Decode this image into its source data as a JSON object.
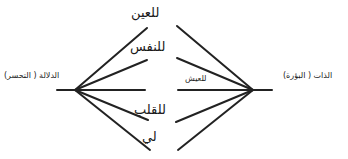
{
  "diagram": {
    "type": "two-hub fan diagram",
    "line_color": "#222222",
    "left_node": {
      "label": "الدلالة ( التحسر)"
    },
    "right_node": {
      "label": "الذات ( البؤرة)"
    },
    "branches": [
      {
        "label": "للعين"
      },
      {
        "label": "للنفس"
      },
      {
        "label": "للعيش"
      },
      {
        "label": "للقلب"
      },
      {
        "label": "لي"
      }
    ]
  }
}
